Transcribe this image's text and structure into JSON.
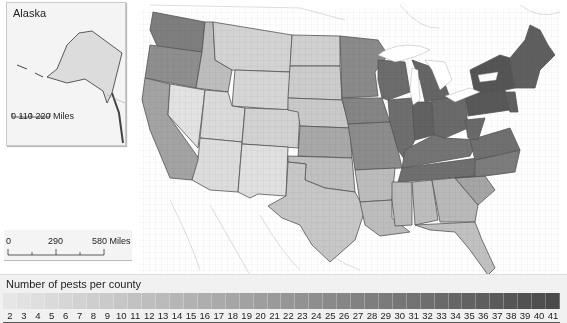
{
  "map": {
    "title": "Number of pests per county",
    "inset": {
      "title": "Alaska",
      "scale_labels": [
        "0",
        "110",
        "220 Miles"
      ]
    },
    "scalebar": {
      "labels": [
        "0",
        "290",
        "580 Miles"
      ]
    },
    "legend": {
      "title": "Number of pests per county",
      "min": 2,
      "max": 41,
      "bins": [
        "2",
        "3",
        "4",
        "5",
        "6",
        "7",
        "8",
        "9",
        "10",
        "11",
        "12",
        "13",
        "14",
        "15",
        "16",
        "17",
        "18",
        "19",
        "20",
        "21",
        "22",
        "23",
        "24",
        "25",
        "26",
        "27",
        "28",
        "29",
        "30",
        "31",
        "32",
        "33",
        "34",
        "35",
        "36",
        "37",
        "38",
        "39",
        "40",
        "41"
      ],
      "color_low": "#e6e6e6",
      "color_high": "#4a4a4a"
    },
    "regions_shading": {
      "pacific_northwest": "#8c8c8c",
      "california": "#a5a5a5",
      "mountain_west": "#d6d6d6",
      "southwest": "#dedede",
      "great_plains": "#cccccc",
      "upper_midwest": "#808080",
      "great_lakes": "#6a6a6a",
      "northeast": "#5a5a5a",
      "south": "#b8b8b8",
      "texas": "#c4c4c4",
      "florida": "#c0c0c0"
    }
  }
}
